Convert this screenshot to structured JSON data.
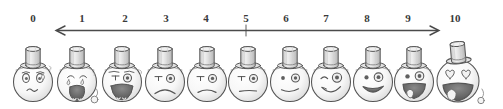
{
  "diagram": {
    "style": "pencil sketch, grayscale",
    "background_color": "#ffffff",
    "ink_color": "#4a4a4a",
    "number_color": "#3a3a3a"
  },
  "scale": {
    "axis": {
      "type": "double-headed-arrow",
      "left_arrow": true,
      "right_arrow": true,
      "y": 30,
      "x_start": 55,
      "x_end": 440,
      "tick_at": 5
    },
    "labels": [
      "0",
      "1",
      "2",
      "3",
      "4",
      "5",
      "6",
      "7",
      "8",
      "9",
      "10"
    ],
    "label_x": [
      33,
      82,
      125,
      166,
      206,
      246,
      286,
      326,
      367,
      408,
      455
    ],
    "min": 0,
    "max": 10
  },
  "faces": [
    {
      "value": "0",
      "name": "face-crying-worried",
      "expression": "crying, worried brows, teardrop",
      "mouth": "wavy-frown",
      "eyes": "worried-oval",
      "tear": true,
      "hat": "top-hat",
      "cx": 33
    },
    {
      "value": "1",
      "name": "face-wailing",
      "expression": "wailing, wide open mouth with teeth",
      "mouth": "open-wail",
      "eyes": "sad-closed",
      "tear": true,
      "hat": "top-hat",
      "cx": 77
    },
    {
      "value": "2",
      "name": "face-distressed",
      "expression": "distressed, open mouth, furrowed brows",
      "mouth": "open-frown",
      "eyes": "squint-sad",
      "tear": true,
      "hat": "top-hat",
      "cx": 122
    },
    {
      "value": "3",
      "name": "face-frowning",
      "expression": "frowning, unhappy",
      "mouth": "deep-frown",
      "eyes": "round-sad",
      "tear": false,
      "hat": "top-hat",
      "cx": 165
    },
    {
      "value": "4",
      "name": "face-slightly-frowning",
      "expression": "slightly frowning",
      "mouth": "small-frown",
      "eyes": "round",
      "tear": false,
      "hat": "top-hat",
      "cx": 207
    },
    {
      "value": "5",
      "name": "face-neutral",
      "expression": "neutral, flat mouth",
      "mouth": "flat",
      "eyes": "round",
      "tear": false,
      "hat": "top-hat",
      "cx": 248
    },
    {
      "value": "6",
      "name": "face-slight-smile",
      "expression": "slight smile",
      "mouth": "small-smile",
      "eyes": "round",
      "tear": false,
      "hat": "top-hat",
      "cx": 290
    },
    {
      "value": "7",
      "name": "face-winking-smile",
      "expression": "winking with a smile",
      "mouth": "smile",
      "eyes": "wink",
      "tear": false,
      "hat": "top-hat",
      "cx": 331
    },
    {
      "value": "8",
      "name": "face-happy-grin",
      "expression": "happy open grin",
      "mouth": "grin",
      "eyes": "round-bright",
      "tear": false,
      "hat": "top-hat",
      "cx": 373
    },
    {
      "value": "9",
      "name": "face-laughing",
      "expression": "laughing, open mouth with tongue",
      "mouth": "open-laugh",
      "eyes": "round-bright",
      "tear": false,
      "hat": "top-hat",
      "cx": 414
    },
    {
      "value": "10",
      "name": "face-heart-eyes-laughing",
      "expression": "heart eyes, huge laugh, tilted hat",
      "mouth": "big-open-laugh",
      "eyes": "hearts",
      "tear": false,
      "hat": "top-hat-tilted",
      "cx": 458
    }
  ]
}
